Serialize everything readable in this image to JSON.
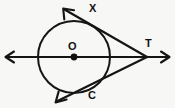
{
  "figure": {
    "background_color": "#f7f7f5",
    "stroke_color": "#151515",
    "labels": {
      "center": "O",
      "upper_tangent_point": "X",
      "lower_tangent_point": "C",
      "external_point": "T"
    },
    "circle": {
      "center_x": 74,
      "center_y": 57,
      "radius": 36,
      "stroke_width": 2.0
    },
    "center_dot": {
      "cx": 74,
      "cy": 57,
      "r": 3.4
    },
    "secant_line": {
      "description": "horizontal line through center with arrowheads at both ends",
      "x1": 6,
      "y1": 57,
      "x2": 169,
      "y2": 57,
      "stroke_width": 2.0,
      "left_arrow": "west-arrowhead",
      "right_arrow": "east-arrowhead"
    },
    "upper_tangent": {
      "description": "tangent through X extending beyond to upper-left arrowhead, meeting T",
      "x1": 64,
      "y1": 9,
      "x2": 147,
      "y2": 57,
      "stroke_width": 2.2,
      "arrow": "northwest-arrowhead",
      "tangent_point_x": 87,
      "tangent_point_y": 22
    },
    "lower_tangent": {
      "description": "tangent through C extending beyond to lower-left arrowhead, meeting T",
      "x1": 56,
      "y1": 102,
      "x2": 147,
      "y2": 57,
      "stroke_width": 2.2,
      "arrow": "southwest-arrowhead",
      "tangent_point_x": 99,
      "tangent_point_y": 85
    },
    "external_point": {
      "x": 147,
      "y": 57
    }
  }
}
